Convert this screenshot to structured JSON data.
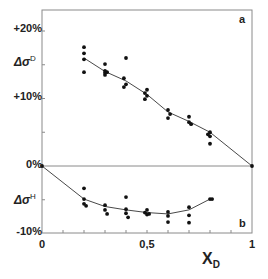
{
  "chart_data": [
    {
      "type": "scatter",
      "panel": "a",
      "ylabel": "Δσ D",
      "xlabel": "X_D",
      "xlim": [
        0,
        1
      ],
      "ylim": [
        -10,
        23
      ],
      "x_ticks": [
        "0",
        "0,5",
        "1"
      ],
      "y_ticks": [
        "+20%",
        "+10%",
        "0%",
        "-10%"
      ],
      "grid": false,
      "series": [
        {
          "name": "Δσ D points",
          "points": [
            [
              0.2,
              17.6
            ],
            [
              0.2,
              16.7
            ],
            [
              0.2,
              15.8
            ],
            [
              0.2,
              13.9
            ],
            [
              0.3,
              15.1
            ],
            [
              0.3,
              14.1
            ],
            [
              0.3,
              13.8
            ],
            [
              0.3,
              13.5
            ],
            [
              0.31,
              13.9
            ],
            [
              0.4,
              16.0
            ],
            [
              0.39,
              13.0
            ],
            [
              0.4,
              12.1
            ],
            [
              0.39,
              11.7
            ],
            [
              0.5,
              11.3
            ],
            [
              0.49,
              10.8
            ],
            [
              0.5,
              10.4
            ],
            [
              0.49,
              9.9
            ],
            [
              0.6,
              8.3
            ],
            [
              0.61,
              7.7
            ],
            [
              0.6,
              7.1
            ],
            [
              0.7,
              7.3
            ],
            [
              0.7,
              6.5
            ],
            [
              0.71,
              6.2
            ],
            [
              0.8,
              5.0
            ],
            [
              0.79,
              4.7
            ],
            [
              0.8,
              4.4
            ],
            [
              0.8,
              3.3
            ],
            [
              1.0,
              0.0
            ]
          ]
        },
        {
          "name": "Δσ D fit",
          "line": [
            [
              0.2,
              16.0
            ],
            [
              0.3,
              14.0
            ],
            [
              0.4,
              12.6
            ],
            [
              0.5,
              10.6
            ],
            [
              0.6,
              8.0
            ],
            [
              0.7,
              6.6
            ],
            [
              0.8,
              5.0
            ],
            [
              1.0,
              0.0
            ]
          ]
        }
      ]
    },
    {
      "type": "scatter",
      "panel": "b",
      "ylabel": "Δσ H",
      "xlabel": "X_D",
      "xlim": [
        0,
        1
      ],
      "ylim": [
        -10,
        0
      ],
      "series": [
        {
          "name": "Δσ H points",
          "points": [
            [
              0.0,
              0.0
            ],
            [
              0.2,
              -3.3
            ],
            [
              0.2,
              -4.9
            ],
            [
              0.2,
              -5.6
            ],
            [
              0.21,
              -5.9
            ],
            [
              0.3,
              -5.8
            ],
            [
              0.3,
              -6.5
            ],
            [
              0.31,
              -7.1
            ],
            [
              0.4,
              -4.6
            ],
            [
              0.4,
              -6.4
            ],
            [
              0.4,
              -7.0
            ],
            [
              0.41,
              -7.6
            ],
            [
              0.49,
              -6.9
            ],
            [
              0.5,
              -6.5
            ],
            [
              0.51,
              -7.1
            ],
            [
              0.5,
              -7.2
            ],
            [
              0.6,
              -6.8
            ],
            [
              0.6,
              -7.4
            ],
            [
              0.6,
              -8.3
            ],
            [
              0.7,
              -6.1
            ],
            [
              0.7,
              -7.3
            ],
            [
              0.7,
              -8.4
            ],
            [
              0.8,
              -4.9
            ],
            [
              0.81,
              -4.9
            ]
          ]
        },
        {
          "name": "Δσ H fit",
          "line": [
            [
              0.0,
              0.0
            ],
            [
              0.2,
              -4.9
            ],
            [
              0.3,
              -6.0
            ],
            [
              0.4,
              -6.5
            ],
            [
              0.5,
              -6.9
            ],
            [
              0.6,
              -7.1
            ],
            [
              0.7,
              -6.5
            ],
            [
              0.8,
              -4.9
            ]
          ]
        }
      ]
    }
  ],
  "labels": {
    "y_ticks": {
      "p20": "+20%",
      "p10": "+10%",
      "zero": "0%",
      "m10": "-10%"
    },
    "x_ticks": {
      "zero": "0",
      "half": "0,5",
      "one": "1"
    },
    "ylabel_top": {
      "main": "Δσ",
      "sup": "D"
    },
    "ylabel_bottom": {
      "main": "Δσ",
      "sup": "H"
    },
    "xlabel": {
      "main": "X",
      "sub": "D"
    },
    "panel_a": "a",
    "panel_b": "b"
  },
  "style": {
    "axis_color": "#8a8a8a",
    "point_color": "#111111",
    "line_color": "#333333"
  }
}
